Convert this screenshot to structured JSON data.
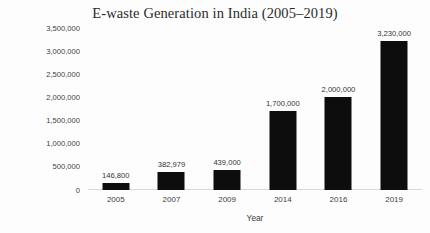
{
  "chart_data": {
    "type": "bar",
    "title": "E-waste Generation in India (2005–2019)",
    "xlabel": "Year",
    "ylabel": "E-waste  generated in MT",
    "categories": [
      "2005",
      "2007",
      "2009",
      "2014",
      "2016",
      "2019"
    ],
    "values": [
      146800,
      382979,
      439000,
      1700000,
      2000000,
      3230000
    ],
    "value_labels": [
      "146,800",
      "382,979",
      "439,000",
      "1,700,000",
      "2,000,000",
      "3,230,000"
    ],
    "ylim": [
      0,
      3500000
    ],
    "ytick_values": [
      0,
      500000,
      1000000,
      1500000,
      2000000,
      2500000,
      3000000,
      3500000
    ],
    "ytick_labels": [
      "0",
      "500,000",
      "1,000,000",
      "1,500,000",
      "2,000,000",
      "2,500,000",
      "3,000,000",
      "3,500,000"
    ],
    "grid": false,
    "legend": "none",
    "bar_color": "#0d0d0d",
    "axis_color": "#d8d8d8",
    "background": "#ffffff"
  }
}
